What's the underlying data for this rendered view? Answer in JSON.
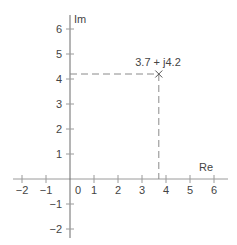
{
  "chart_data": {
    "type": "scatter",
    "title": "",
    "xlabel": "Re",
    "ylabel": "Im",
    "xlim": [
      -2,
      6
    ],
    "ylim": [
      -2,
      6
    ],
    "x_ticks": [
      -2,
      -1,
      0,
      1,
      2,
      3,
      4,
      5,
      6
    ],
    "y_ticks": [
      -2,
      -1,
      1,
      2,
      3,
      4,
      5,
      6
    ],
    "x_tick_labels": [
      "−2",
      "−1",
      "0",
      "1",
      "2",
      "3",
      "4",
      "5",
      "6"
    ],
    "y_tick_labels": [
      "−2",
      "−1",
      "1",
      "2",
      "3",
      "4",
      "5",
      "6"
    ],
    "grid": false,
    "points": [
      {
        "x": 3.7,
        "y": 4.2,
        "label": "3.7 + j4.2",
        "marker": "x"
      }
    ],
    "projection_lines": "dashed"
  },
  "labels": {
    "re_axis": "Re",
    "im_axis": "Im",
    "point": "3.7 + j4.2",
    "origin": "0"
  },
  "colors": {
    "axis": "#9a9a9a",
    "text": "#444444",
    "dashed": "#8a8a8a"
  }
}
